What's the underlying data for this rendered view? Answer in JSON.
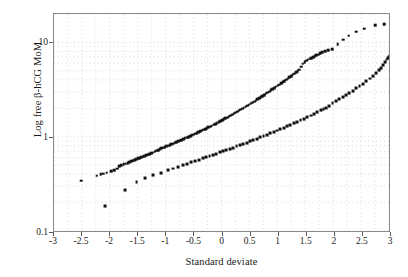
{
  "chart_data": {
    "type": "scatter",
    "title": "",
    "xlabel": "Standard deviate",
    "ylabel": "Log free β-hCG MoM",
    "xlim": [
      -3,
      3
    ],
    "ylim": [
      0.1,
      20
    ],
    "yscale": "log",
    "grid": true,
    "grid_style": "dotted",
    "legend": "none",
    "xticks": [
      "-3",
      "-2.5",
      "-2",
      "-1.5",
      "-1",
      "-0.5",
      "0",
      "0.5",
      "1",
      "1.5",
      "2",
      "2.5",
      "3"
    ],
    "xtick_values": [
      -3,
      -2.5,
      -2,
      -1.5,
      -1,
      -0.5,
      0,
      0.5,
      1,
      1.5,
      2,
      2.5,
      3
    ],
    "yticks": [
      "10",
      "1",
      "0.1"
    ],
    "ytick_values": [
      10,
      1,
      0.1
    ],
    "series": [
      {
        "name": "upper-series",
        "marker": "square",
        "color": "#111111",
        "points": [
          [
            -2.52,
            0.355
          ],
          [
            -2.24,
            0.4
          ],
          [
            -2.17,
            0.415
          ],
          [
            -2.12,
            0.42
          ],
          [
            -2.06,
            0.43
          ],
          [
            -1.98,
            0.445
          ],
          [
            -1.93,
            0.455
          ],
          [
            -1.88,
            0.475
          ],
          [
            -1.84,
            0.5
          ],
          [
            -1.8,
            0.515
          ],
          [
            -1.76,
            0.525
          ],
          [
            -1.72,
            0.535
          ],
          [
            -1.69,
            0.545
          ],
          [
            -1.66,
            0.555
          ],
          [
            -1.63,
            0.565
          ],
          [
            -1.6,
            0.575
          ],
          [
            -1.57,
            0.585
          ],
          [
            -1.54,
            0.6
          ],
          [
            -1.51,
            0.61
          ],
          [
            -1.48,
            0.615
          ],
          [
            -1.45,
            0.625
          ],
          [
            -1.42,
            0.635
          ],
          [
            -1.39,
            0.645
          ],
          [
            -1.36,
            0.655
          ],
          [
            -1.33,
            0.665
          ],
          [
            -1.3,
            0.675
          ],
          [
            -1.27,
            0.685
          ],
          [
            -1.24,
            0.7
          ],
          [
            -1.21,
            0.715
          ],
          [
            -1.18,
            0.73
          ],
          [
            -1.15,
            0.745
          ],
          [
            -1.12,
            0.76
          ],
          [
            -1.09,
            0.775
          ],
          [
            -1.06,
            0.79
          ],
          [
            -1.03,
            0.8
          ],
          [
            -1.0,
            0.815
          ],
          [
            -0.97,
            0.825
          ],
          [
            -0.94,
            0.84
          ],
          [
            -0.91,
            0.855
          ],
          [
            -0.88,
            0.87
          ],
          [
            -0.85,
            0.885
          ],
          [
            -0.82,
            0.9
          ],
          [
            -0.79,
            0.915
          ],
          [
            -0.76,
            0.93
          ],
          [
            -0.73,
            0.945
          ],
          [
            -0.7,
            0.965
          ],
          [
            -0.67,
            0.985
          ],
          [
            -0.64,
            1.0
          ],
          [
            -0.61,
            1.02
          ],
          [
            -0.58,
            1.04
          ],
          [
            -0.55,
            1.06
          ],
          [
            -0.52,
            1.08
          ],
          [
            -0.49,
            1.1
          ],
          [
            -0.46,
            1.12
          ],
          [
            -0.43,
            1.145
          ],
          [
            -0.4,
            1.17
          ],
          [
            -0.37,
            1.19
          ],
          [
            -0.34,
            1.215
          ],
          [
            -0.31,
            1.24
          ],
          [
            -0.28,
            1.265
          ],
          [
            -0.25,
            1.29
          ],
          [
            -0.22,
            1.315
          ],
          [
            -0.19,
            1.345
          ],
          [
            -0.16,
            1.375
          ],
          [
            -0.13,
            1.4
          ],
          [
            -0.1,
            1.43
          ],
          [
            -0.07,
            1.46
          ],
          [
            -0.04,
            1.495
          ],
          [
            -0.01,
            1.53
          ],
          [
            0.02,
            1.565
          ],
          [
            0.05,
            1.6
          ],
          [
            0.08,
            1.635
          ],
          [
            0.11,
            1.67
          ],
          [
            0.14,
            1.71
          ],
          [
            0.17,
            1.75
          ],
          [
            0.2,
            1.79
          ],
          [
            0.23,
            1.835
          ],
          [
            0.26,
            1.88
          ],
          [
            0.29,
            1.925
          ],
          [
            0.32,
            1.97
          ],
          [
            0.35,
            2.02
          ],
          [
            0.38,
            2.07
          ],
          [
            0.41,
            2.12
          ],
          [
            0.44,
            2.17
          ],
          [
            0.47,
            2.22
          ],
          [
            0.5,
            2.28
          ],
          [
            0.53,
            2.34
          ],
          [
            0.56,
            2.4
          ],
          [
            0.59,
            2.46
          ],
          [
            0.62,
            2.53
          ],
          [
            0.65,
            2.6
          ],
          [
            0.68,
            2.67
          ],
          [
            0.71,
            2.74
          ],
          [
            0.74,
            2.82
          ],
          [
            0.77,
            2.9
          ],
          [
            0.8,
            2.98
          ],
          [
            0.83,
            3.06
          ],
          [
            0.86,
            3.15
          ],
          [
            0.89,
            3.24
          ],
          [
            0.92,
            3.33
          ],
          [
            0.95,
            3.43
          ],
          [
            0.98,
            3.53
          ],
          [
            1.01,
            3.63
          ],
          [
            1.04,
            3.74
          ],
          [
            1.07,
            3.85
          ],
          [
            1.1,
            3.96
          ],
          [
            1.13,
            4.08
          ],
          [
            1.16,
            4.2
          ],
          [
            1.19,
            4.33
          ],
          [
            1.22,
            4.46
          ],
          [
            1.25,
            4.6
          ],
          [
            1.28,
            4.74
          ],
          [
            1.31,
            4.89
          ],
          [
            1.34,
            5.04
          ],
          [
            1.37,
            5.2
          ],
          [
            1.4,
            5.6
          ],
          [
            1.43,
            6.0
          ],
          [
            1.46,
            6.25
          ],
          [
            1.49,
            6.45
          ],
          [
            1.52,
            6.6
          ],
          [
            1.55,
            6.75
          ],
          [
            1.58,
            6.9
          ],
          [
            1.61,
            7.05
          ],
          [
            1.64,
            7.2
          ],
          [
            1.67,
            7.35
          ],
          [
            1.7,
            7.5
          ],
          [
            1.74,
            7.7
          ],
          [
            1.78,
            7.9
          ],
          [
            1.83,
            8.1
          ],
          [
            1.88,
            8.3
          ],
          [
            1.95,
            8.55
          ],
          [
            2.05,
            9.6
          ],
          [
            2.15,
            10.7
          ],
          [
            2.25,
            11.8
          ],
          [
            2.38,
            13.0
          ],
          [
            2.52,
            14.0
          ],
          [
            2.72,
            15.3
          ],
          [
            2.88,
            15.6
          ]
        ]
      },
      {
        "name": "lower-series",
        "marker": "square",
        "color": "#111111",
        "points": [
          [
            -2.09,
            0.193
          ],
          [
            -1.73,
            0.283
          ],
          [
            -1.53,
            0.345
          ],
          [
            -1.38,
            0.375
          ],
          [
            -1.24,
            0.405
          ],
          [
            -1.1,
            0.425
          ],
          [
            -0.97,
            0.455
          ],
          [
            -0.88,
            0.475
          ],
          [
            -0.79,
            0.495
          ],
          [
            -0.71,
            0.515
          ],
          [
            -0.63,
            0.535
          ],
          [
            -0.56,
            0.552
          ],
          [
            -0.49,
            0.57
          ],
          [
            -0.42,
            0.588
          ],
          [
            -0.35,
            0.607
          ],
          [
            -0.29,
            0.625
          ],
          [
            -0.23,
            0.643
          ],
          [
            -0.17,
            0.662
          ],
          [
            -0.11,
            0.682
          ],
          [
            -0.05,
            0.702
          ],
          [
            0.01,
            0.722
          ],
          [
            0.07,
            0.743
          ],
          [
            0.13,
            0.765
          ],
          [
            0.19,
            0.788
          ],
          [
            0.25,
            0.812
          ],
          [
            0.31,
            0.837
          ],
          [
            0.37,
            0.863
          ],
          [
            0.43,
            0.89
          ],
          [
            0.49,
            0.918
          ],
          [
            0.55,
            0.948
          ],
          [
            0.61,
            0.978
          ],
          [
            0.67,
            1.01
          ],
          [
            0.73,
            1.044
          ],
          [
            0.79,
            1.078
          ],
          [
            0.85,
            1.114
          ],
          [
            0.91,
            1.152
          ],
          [
            0.97,
            1.192
          ],
          [
            1.03,
            1.233
          ],
          [
            1.09,
            1.276
          ],
          [
            1.15,
            1.322
          ],
          [
            1.21,
            1.37
          ],
          [
            1.27,
            1.42
          ],
          [
            1.33,
            1.473
          ],
          [
            1.39,
            1.529
          ],
          [
            1.45,
            1.588
          ],
          [
            1.51,
            1.65
          ],
          [
            1.57,
            1.716
          ],
          [
            1.63,
            1.786
          ],
          [
            1.69,
            1.86
          ],
          [
            1.75,
            1.938
          ],
          [
            1.8,
            2.01
          ],
          [
            1.85,
            2.07
          ],
          [
            1.9,
            2.18
          ],
          [
            1.96,
            2.3
          ],
          [
            2.02,
            2.42
          ],
          [
            2.08,
            2.54
          ],
          [
            2.14,
            2.67
          ],
          [
            2.2,
            2.81
          ],
          [
            2.26,
            2.96
          ],
          [
            2.32,
            3.12
          ],
          [
            2.38,
            3.3
          ],
          [
            2.44,
            3.49
          ],
          [
            2.5,
            3.7
          ],
          [
            2.56,
            3.93
          ],
          [
            2.62,
            4.19
          ],
          [
            2.68,
            4.48
          ],
          [
            2.73,
            4.78
          ],
          [
            2.78,
            5.1
          ],
          [
            2.82,
            5.45
          ],
          [
            2.86,
            5.85
          ],
          [
            2.89,
            6.25
          ],
          [
            2.92,
            6.65
          ],
          [
            2.95,
            6.95
          ],
          [
            2.97,
            7.15
          ],
          [
            2.98,
            7.25
          ]
        ]
      }
    ]
  }
}
